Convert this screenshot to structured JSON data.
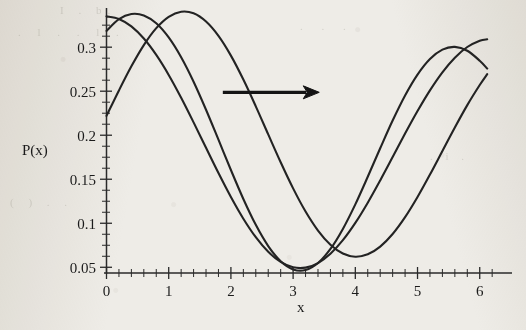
{
  "figure": {
    "background_color": "#eeece7",
    "ink_color": "#232323",
    "axis_label_x": "x",
    "axis_label_y": "P(x)",
    "annotation_arrow": {
      "name": "rightward-shift-arrow",
      "direction": "right",
      "x_start_data": 1.87,
      "x_end_data": 3.42,
      "y_data": 0.2487
    }
  },
  "chart_data": {
    "type": "line",
    "title": "",
    "xlabel": "x",
    "ylabel": "P(x)",
    "xlim": [
      0,
      6.35
    ],
    "ylim": [
      0.0435,
      0.3445
    ],
    "grid": false,
    "legend": "none",
    "xticks": [
      0,
      1,
      2,
      3,
      4,
      5,
      6
    ],
    "xticklabels": [
      "0",
      "1",
      "2",
      "3",
      "4",
      "5",
      "6"
    ],
    "x_minor_tick_step": 0.2,
    "yticks": [
      0.05,
      0.1,
      0.15,
      0.2,
      0.25,
      0.3
    ],
    "yticklabels": [
      "0.05",
      "0.1",
      "0.15",
      "0.2",
      "0.25",
      "0.3"
    ],
    "y_minor_tick_step": 0.0125,
    "series": [
      {
        "name": "curve-1",
        "phase_shift": 0.0,
        "peak_x": 0.0,
        "peak_y": 0.335,
        "min_x": 3.38,
        "min_y": 0.0495,
        "start_point": [
          0.0,
          0.335
        ],
        "end_point": [
          6.12,
          0.221
        ],
        "points_x": [
          0.0,
          0.2,
          0.4,
          0.6,
          0.8,
          1.0,
          1.2,
          1.4,
          1.6,
          1.8,
          2.0,
          2.2,
          2.4,
          2.6,
          2.8,
          3.0,
          3.2,
          3.4,
          3.6,
          3.8,
          4.0,
          4.2,
          4.4,
          4.6,
          4.8,
          5.0,
          5.2,
          5.4,
          5.6,
          5.8,
          6.0,
          6.12
        ],
        "points_y": [
          0.335,
          0.3321,
          0.3236,
          0.3098,
          0.2912,
          0.2685,
          0.2426,
          0.2146,
          0.1857,
          0.157,
          0.1298,
          0.1052,
          0.0842,
          0.0676,
          0.0561,
          0.05,
          0.0496,
          0.0548,
          0.0654,
          0.0808,
          0.1004,
          0.1234,
          0.1487,
          0.1752,
          0.2019,
          0.2275,
          0.251,
          0.2715,
          0.2881,
          0.3002,
          0.3074,
          0.3089
        ]
      },
      {
        "name": "curve-2",
        "phase_shift": 0.47,
        "peak_x": 0.47,
        "peak_y": 0.338,
        "min_x": 3.62,
        "min_y": 0.0495,
        "start_point": [
          0.0,
          0.3185
        ],
        "end_point": [
          6.12,
          0.2832
        ],
        "points_x": [
          0.0,
          0.2,
          0.4,
          0.6,
          0.8,
          1.0,
          1.2,
          1.4,
          1.6,
          1.8,
          2.0,
          2.2,
          2.4,
          2.6,
          2.8,
          3.0,
          3.2,
          3.4,
          3.6,
          3.8,
          4.0,
          4.2,
          4.4,
          4.6,
          4.8,
          5.0,
          5.2,
          5.4,
          5.6,
          5.8,
          6.0,
          6.12
        ],
        "points_y": [
          0.3185,
          0.3318,
          0.3377,
          0.3361,
          0.3271,
          0.311,
          0.2885,
          0.2607,
          0.2289,
          0.1949,
          0.1605,
          0.1276,
          0.0982,
          0.0741,
          0.0569,
          0.0476,
          0.0469,
          0.0549,
          0.0708,
          0.0936,
          0.1215,
          0.1528,
          0.1852,
          0.2167,
          0.2452,
          0.2689,
          0.2866,
          0.2972,
          0.3003,
          0.2959,
          0.2846,
          0.2757
        ]
      },
      {
        "name": "curve-3",
        "phase_shift": 1.08,
        "peak_x": 1.08,
        "peak_y": 0.3385,
        "min_x": 3.9,
        "min_y": 0.0497,
        "start_point": [
          0.0,
          0.222
        ],
        "end_point": [
          6.12,
          0.3356
        ],
        "points_x": [
          0.0,
          0.2,
          0.4,
          0.6,
          0.8,
          1.0,
          1.2,
          1.4,
          1.6,
          1.8,
          2.0,
          2.2,
          2.4,
          2.6,
          2.8,
          3.0,
          3.2,
          3.4,
          3.6,
          3.8,
          4.0,
          4.2,
          4.4,
          4.6,
          4.8,
          5.0,
          5.2,
          5.4,
          5.6,
          5.8,
          6.0,
          6.12
        ],
        "points_y": [
          0.222,
          0.2509,
          0.2783,
          0.3024,
          0.3216,
          0.3345,
          0.3403,
          0.3385,
          0.3291,
          0.3128,
          0.2904,
          0.2632,
          0.2328,
          0.2009,
          0.1693,
          0.1396,
          0.1133,
          0.0917,
          0.0756,
          0.0656,
          0.062,
          0.0647,
          0.0735,
          0.0878,
          0.1069,
          0.1298,
          0.1553,
          0.1821,
          0.2088,
          0.2342,
          0.257,
          0.2693
        ]
      }
    ]
  }
}
